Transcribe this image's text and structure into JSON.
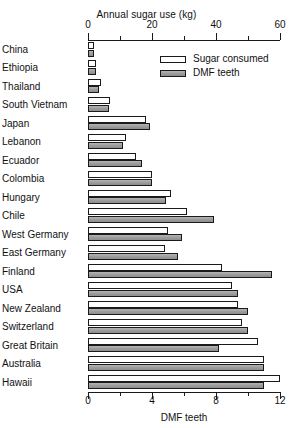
{
  "chart_data": {
    "type": "bar",
    "orientation": "horizontal",
    "title": "",
    "top_axis_label": "Annual sugar use (kg)",
    "bottom_axis_label": "DMF teeth",
    "top_ticks": [
      0,
      20,
      40,
      60
    ],
    "bottom_ticks": [
      0,
      4,
      8,
      12
    ],
    "top_axis_range": [
      0,
      60
    ],
    "bottom_axis_range": [
      0,
      12
    ],
    "grid": false,
    "legend_position": "upper-right-inside",
    "categories": [
      "China",
      "Ethiopia",
      "Thailand",
      "South Vietnam",
      "Japan",
      "Lebanon",
      "Ecuador",
      "Colombia",
      "Hungary",
      "Chile",
      "West Germany",
      "East Germany",
      "Finland",
      "USA",
      "New Zealand",
      "Switzerland",
      "Great Britain",
      "Australia",
      "Hawaii"
    ],
    "series": [
      {
        "name": "Sugar consumed",
        "unit": "kg",
        "axis": "top",
        "color": "#ffffff",
        "values": [
          2,
          2.5,
          4,
          7,
          18,
          12,
          15,
          20,
          26,
          31,
          25,
          24,
          42,
          45,
          47,
          48,
          53,
          55,
          60
        ]
      },
      {
        "name": "DMF teeth",
        "unit": "teeth",
        "axis": "bottom",
        "color": "#9e9e9e",
        "values": [
          0.4,
          0.5,
          0.7,
          1.3,
          3.9,
          2.2,
          3.4,
          4.0,
          4.9,
          7.9,
          5.9,
          5.6,
          11.5,
          9.4,
          10.0,
          10.0,
          8.2,
          11.0,
          11.0
        ]
      }
    ]
  },
  "legend": {
    "items": [
      {
        "label": "Sugar consumed",
        "swatch": "open-white-bar"
      },
      {
        "label": "DMF teeth",
        "swatch": "filled-gray-bar"
      }
    ]
  }
}
